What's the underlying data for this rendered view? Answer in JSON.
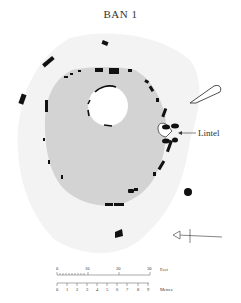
{
  "title": "BAN 1",
  "annotations": {
    "lintel_label": "Lintel"
  },
  "north_arrow": {
    "direction": "left"
  },
  "scale_bar": {
    "feet_label": "Feet",
    "feet_ticks": [
      "0",
      "10",
      "20",
      "30"
    ],
    "metres_label": "Metres",
    "metres_ticks": [
      "0",
      "1",
      "2",
      "3",
      "4",
      "5",
      "6",
      "7",
      "8",
      "9"
    ]
  },
  "colors": {
    "mound_fill": "#d2d2d2",
    "outer_area_fill": "#f2f2f2",
    "stones": "#111111",
    "text": "#333333"
  }
}
